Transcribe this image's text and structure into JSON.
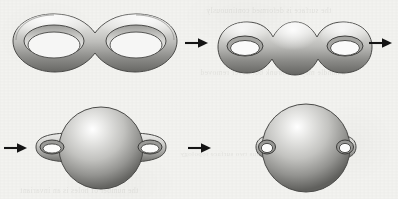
{
  "figure": {
    "title": "Deformation of a genus-2 surface",
    "caption": "",
    "width": 398,
    "height": 199,
    "background_color": "#f3f3f0",
    "ink_color": "#1a1a1a",
    "surface_light_color": "#e8e8e6",
    "surface_mid_color": "#b9b9b6",
    "surface_dark_color": "#6e6e6c",
    "surface_outline_color": "#4a4a48"
  },
  "bleed_text": [
    {
      "text": "the surface is deformed continuously",
      "x": 206,
      "y": 6,
      "size": 7.5
    },
    {
      "text": "a handle may be shrunk but never removed",
      "x": 200,
      "y": 68,
      "size": 7.5
    },
    {
      "text": "the number of holes is an invariant",
      "x": 20,
      "y": 186,
      "size": 7.5
    },
    {
      "text": "genus two surface topology",
      "x": 180,
      "y": 150,
      "size": 7
    }
  ],
  "panels": [
    {
      "id": "panel-1",
      "name": "flat-double-torus",
      "label": "Flat double torus with two large holes",
      "genus": 2,
      "holes": 2,
      "step": 1,
      "x": 8,
      "y": 8,
      "width": 175,
      "height": 76
    },
    {
      "id": "panel-2",
      "name": "plump-double-torus",
      "label": "Thickened three-lobed double torus with small holes",
      "genus": 2,
      "holes": 2,
      "step": 2,
      "x": 215,
      "y": 14,
      "width": 160,
      "height": 68
    },
    {
      "id": "panel-3",
      "name": "sphere-with-two-handles",
      "label": "Sphere with two side handles",
      "genus": 2,
      "holes": 2,
      "step": 3,
      "x": 26,
      "y": 104,
      "width": 150,
      "height": 88
    },
    {
      "id": "panel-4",
      "name": "sphere-with-small-handles",
      "label": "Sphere with two small handles",
      "genus": 2,
      "holes": 2,
      "step": 4,
      "x": 242,
      "y": 102,
      "width": 128,
      "height": 92
    }
  ],
  "arrows": [
    {
      "id": "arrow-1",
      "name": "arrow-step-1-to-2",
      "direction": "right",
      "x": 185,
      "y": 37,
      "width": 24,
      "height": 12
    },
    {
      "id": "arrow-2",
      "name": "arrow-step-2-to-3",
      "direction": "right",
      "x": 369,
      "y": 37,
      "width": 24,
      "height": 12
    },
    {
      "id": "arrow-3",
      "name": "arrow-wrap-to-step-3",
      "direction": "right",
      "x": 4,
      "y": 142,
      "width": 24,
      "height": 12
    },
    {
      "id": "arrow-4",
      "name": "arrow-step-3-to-4",
      "direction": "right",
      "x": 188,
      "y": 142,
      "width": 24,
      "height": 12
    }
  ]
}
